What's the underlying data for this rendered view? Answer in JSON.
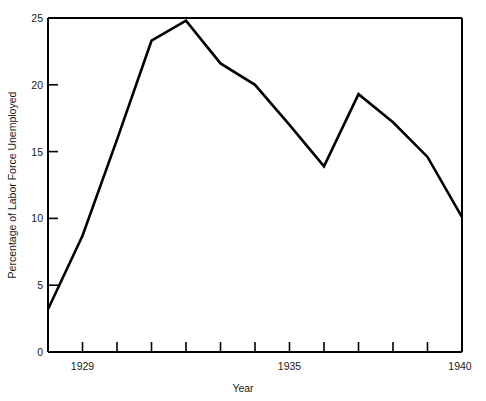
{
  "chart_data": {
    "type": "line",
    "title": "",
    "subtitle": "",
    "xlabel": "Year",
    "ylabel": "Percentage of Labor Force Unemployed",
    "x": [
      1928,
      1929,
      1930,
      1931,
      1932,
      1933,
      1934,
      1935,
      1936,
      1937,
      1938,
      1939,
      1940
    ],
    "values": [
      3.2,
      8.7,
      15.9,
      23.3,
      24.8,
      21.6,
      20.0,
      17.0,
      13.9,
      19.3,
      17.2,
      14.6,
      10.1
    ],
    "series": [
      {
        "name": "Percentage of Labor Force Unemployed",
        "values": [
          3.2,
          8.7,
          15.9,
          23.3,
          24.8,
          21.6,
          20.0,
          17.0,
          13.9,
          19.3,
          17.2,
          14.6,
          10.1
        ]
      }
    ],
    "xlim": [
      1928,
      1940
    ],
    "ylim": [
      0,
      25
    ],
    "yticks": [
      0,
      5,
      10,
      15,
      20,
      25
    ],
    "ytick_labels": [
      "0",
      "5",
      "10",
      "15",
      "20",
      "25"
    ],
    "xticks": [
      1928,
      1929,
      1930,
      1931,
      1932,
      1933,
      1934,
      1935,
      1936,
      1937,
      1938,
      1939,
      1940
    ],
    "xtick_labels": [
      "",
      "1929",
      "",
      "",
      "",
      "",
      "",
      "1935",
      "",
      "",
      "",
      "",
      "1940"
    ],
    "grid": false,
    "legend": false,
    "legend_position": "none",
    "line_color": "#000000",
    "frame_color": "#000000",
    "background_color": "#ffffff",
    "annotations": []
  },
  "axis": {
    "y_title": "Percentage of Labor Force Unemployed",
    "x_title": "Year",
    "y_labels": [
      "25",
      "20",
      "15",
      "10",
      "5",
      "0"
    ],
    "x_labels": [
      "1929",
      "1935",
      "1940"
    ]
  }
}
